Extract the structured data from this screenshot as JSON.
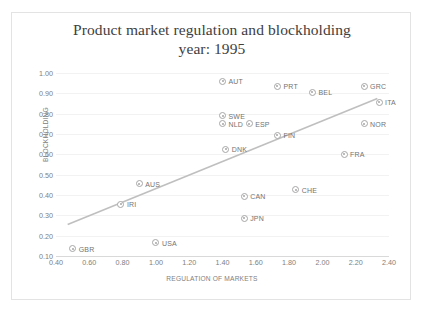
{
  "chart_data": {
    "type": "scatter",
    "title": "Product market regulation and blockholding",
    "subtitle": "year: 1995",
    "xlabel": "REGULATION OF MARKETS",
    "ylabel": "BLOCKHOLDING",
    "xlim": [
      0.4,
      2.4
    ],
    "ylim": [
      0.1,
      1.0
    ],
    "xticks": [
      "0.40",
      "0.60",
      "0.80",
      "1.00",
      "1.20",
      "1.40",
      "1.60",
      "1.80",
      "2.00",
      "2.20",
      "2.40"
    ],
    "xtick_values": [
      0.4,
      0.6,
      0.8,
      1.0,
      1.2,
      1.4,
      1.6,
      1.8,
      2.0,
      2.2,
      2.4
    ],
    "yticks": [
      "0.10",
      "0.20",
      "0.30",
      "0.40",
      "0.50",
      "0.60",
      "0.70",
      "0.80",
      "0.90",
      "1.00"
    ],
    "ytick_values": [
      0.1,
      0.2,
      0.3,
      0.4,
      0.5,
      0.6,
      0.7,
      0.8,
      0.9,
      1.0
    ],
    "grid": true,
    "legend": "none",
    "marker_color": "#a6a6a6",
    "trendline_color": "#bfbfbf",
    "title_color": "#404040",
    "axis_text_color": "#808080",
    "points": [
      {
        "label": "AUT",
        "x": 1.4,
        "y": 0.96
      },
      {
        "label": "PRT",
        "x": 1.73,
        "y": 0.935
      },
      {
        "label": "BEL",
        "x": 1.94,
        "y": 0.905
      },
      {
        "label": "GRC",
        "x": 2.25,
        "y": 0.935
      },
      {
        "label": "ITA",
        "x": 2.34,
        "y": 0.855
      },
      {
        "label": "SWE",
        "x": 1.4,
        "y": 0.79
      },
      {
        "label": "NLD",
        "x": 1.4,
        "y": 0.75
      },
      {
        "label": "ESP",
        "x": 1.56,
        "y": 0.75
      },
      {
        "label": "NOR",
        "x": 2.25,
        "y": 0.75
      },
      {
        "label": "FIN",
        "x": 1.73,
        "y": 0.695
      },
      {
        "label": "DNK",
        "x": 1.42,
        "y": 0.625
      },
      {
        "label": "FRA",
        "x": 2.13,
        "y": 0.6
      },
      {
        "label": "AUS",
        "x": 0.9,
        "y": 0.455
      },
      {
        "label": "CHE",
        "x": 1.84,
        "y": 0.425
      },
      {
        "label": "CAN",
        "x": 1.53,
        "y": 0.395
      },
      {
        "label": "IRI",
        "x": 0.79,
        "y": 0.355
      },
      {
        "label": "JPN",
        "x": 1.53,
        "y": 0.285
      },
      {
        "label": "USA",
        "x": 1.0,
        "y": 0.165
      },
      {
        "label": "GBR",
        "x": 0.5,
        "y": 0.135
      }
    ],
    "trendline": {
      "x0": 0.47,
      "y0": 0.255,
      "x1": 2.33,
      "y1": 0.875
    }
  }
}
